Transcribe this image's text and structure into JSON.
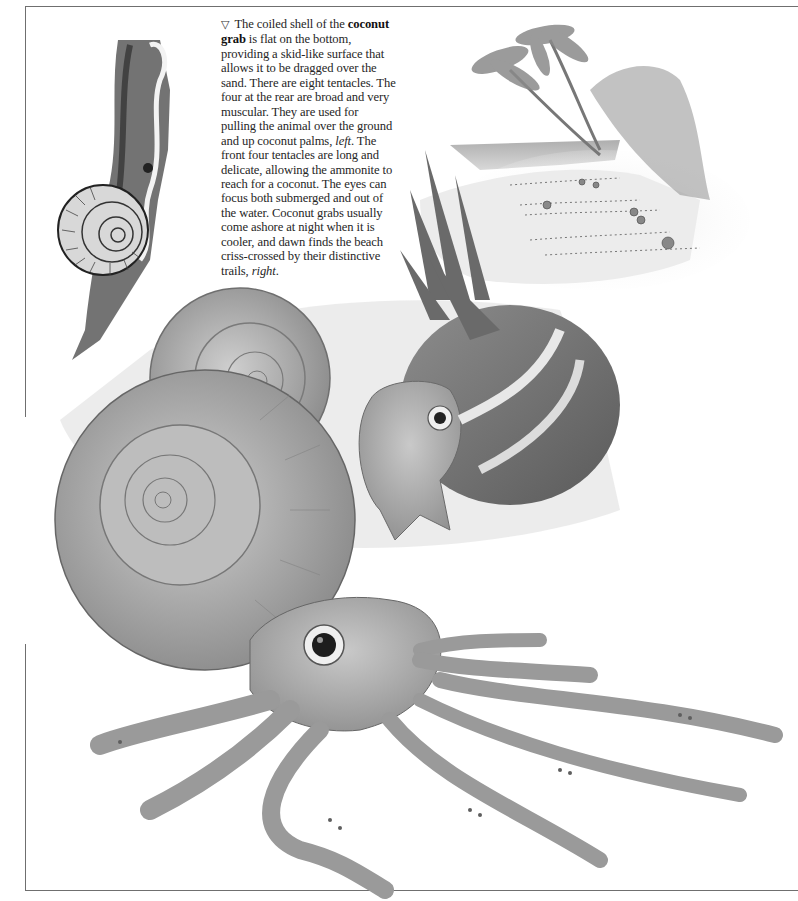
{
  "page": {
    "background": "#ffffff",
    "frame_color": "#6f6f6f"
  },
  "caption": {
    "marker_icon": "triangle-down-outline",
    "marker": "▽",
    "intro": "The coiled shell of the ",
    "term": "coconut grab",
    "body_1": " is flat on the bottom, providing a skid-like surface that allows it to be dragged over the sand. There are eight tentacles. The four at the rear are broad and very muscular. They are used for pulling the animal over the ground and up coconut palms, ",
    "ref_left": "left",
    "body_2": ". The front four tentacles are long and delicate, allowing the ammonite to reach for a coconut. The eyes can focus both submerged and out of the water. Coconut grabs usually come ashore at night when it is cooler, and dawn finds the beach criss-crossed by their distinctive trails, ",
    "ref_right": "right",
    "end": "."
  },
  "illustrations": [
    {
      "id": "sketch-coconut-grab-climbing-palm",
      "style": "pen-and-ink",
      "position": "top-left"
    },
    {
      "id": "beach-scene-with-palms-and-trails",
      "style": "watercolor",
      "position": "top-right"
    },
    {
      "id": "coconut-grab-holding-coconut",
      "style": "watercolor",
      "position": "center"
    },
    {
      "id": "coconut-grab-large-foreground",
      "style": "watercolor",
      "position": "bottom"
    }
  ]
}
